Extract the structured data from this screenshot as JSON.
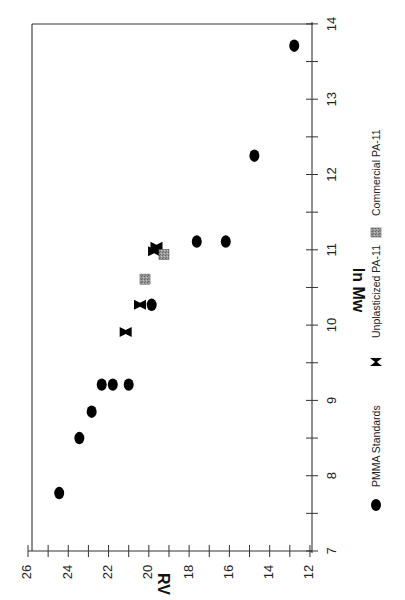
{
  "chart_data": {
    "type": "scatter",
    "title": "",
    "orientation_note": "figure is printed rotated 90 degrees clockwise",
    "xlabel": "ln Mw",
    "ylabel": "RV",
    "xlim": [
      7,
      14
    ],
    "ylim": [
      12,
      26
    ],
    "x_ticks": [
      7,
      8,
      9,
      10,
      11,
      12,
      13,
      14
    ],
    "y_ticks": [
      12,
      14,
      16,
      18,
      20,
      22,
      24,
      26
    ],
    "grid": false,
    "legend_position": "right (below chart in rotated view)",
    "series": [
      {
        "name": "PMMA Standards",
        "marker": "filled-ellipse",
        "color": "#000000",
        "points": [
          {
            "x": 7.77,
            "y": 24.45
          },
          {
            "x": 8.5,
            "y": 23.45
          },
          {
            "x": 8.85,
            "y": 22.84
          },
          {
            "x": 9.21,
            "y": 22.34
          },
          {
            "x": 9.21,
            "y": 21.79
          },
          {
            "x": 9.21,
            "y": 21.0
          },
          {
            "x": 10.27,
            "y": 19.86
          },
          {
            "x": 11.11,
            "y": 17.62
          },
          {
            "x": 11.11,
            "y": 16.18
          },
          {
            "x": 12.25,
            "y": 14.76
          },
          {
            "x": 13.71,
            "y": 12.78
          }
        ]
      },
      {
        "name": "Unplasticized PA-11",
        "marker": "bowtie",
        "color": "#000000",
        "points": [
          {
            "x": 9.91,
            "y": 21.15
          },
          {
            "x": 10.27,
            "y": 20.44
          },
          {
            "x": 10.98,
            "y": 19.74
          },
          {
            "x": 11.04,
            "y": 19.62
          }
        ]
      },
      {
        "name": "Commercial PA-11",
        "marker": "grey-square",
        "color": "#8a8a8a",
        "points": [
          {
            "x": 10.61,
            "y": 20.19
          },
          {
            "x": 10.94,
            "y": 19.25
          }
        ]
      }
    ]
  },
  "axes": {
    "x_title": "ln Mw",
    "y_title": "RV"
  },
  "legend": {
    "items": [
      {
        "label": "PMMA Standards",
        "marker": "ellipse"
      },
      {
        "label": "Unplasticized PA-11",
        "marker": "bowtie"
      },
      {
        "label": "Commercial PA-11",
        "marker": "square"
      }
    ]
  }
}
